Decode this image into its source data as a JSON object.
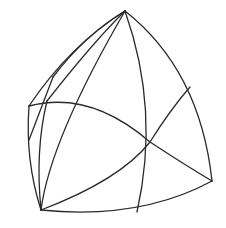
{
  "figure": {
    "stroke_color": "#2a2a2a",
    "stroke_width": 1.3,
    "background": "#ffffff",
    "curves": [
      {
        "name": "outer-right-edge",
        "d": "M125 11 Q 200 70 212 181"
      },
      {
        "name": "outer-bottom-edge",
        "d": "M212 181 Q 140 220 41 210"
      },
      {
        "name": "outer-left-edge",
        "d": "M41 210 Q 25 160 29 106"
      },
      {
        "name": "outer-top-left-edge",
        "d": "M29 106 Q 70 45 125 11"
      },
      {
        "name": "inner-upper-left-arc",
        "d": "M53 77 Q 85 35 125 11"
      },
      {
        "name": "small-left-facet-a",
        "d": "M53 77 L 29 140"
      },
      {
        "name": "inner-arc-47",
        "d": "M47 101 Q 95 40 125 11"
      },
      {
        "name": "inner-vertical-left",
        "d": "M41 210 Q 35 150 47 101"
      },
      {
        "name": "inner-diagonal-73",
        "d": "M41 210 Q 50 140 125 11"
      },
      {
        "name": "central-meridian",
        "d": "M125 11 Q 160 110 137 212"
      },
      {
        "name": "horizontal-band",
        "d": "M29 106 Q 90 90 150 142 Q 185 165 212 181"
      },
      {
        "name": "lower-diagonal",
        "d": "M41 210 Q 120 180 150 142 Q 170 110 190 87"
      }
    ]
  }
}
